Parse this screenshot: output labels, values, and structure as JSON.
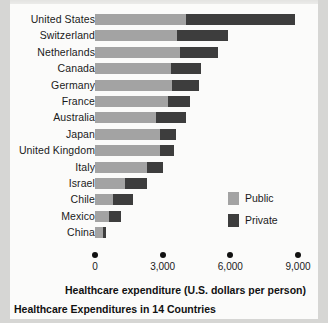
{
  "chart_data": {
    "type": "bar",
    "orientation": "horizontal",
    "stacked": true,
    "title": "",
    "caption": "Healthcare Expenditures in 14 Countries",
    "xlabel": "Healthcare expenditure (U.S. dollars per person)",
    "ylabel": "",
    "xlim": [
      0,
      9000
    ],
    "xticks": [
      0,
      3000,
      6000,
      9000
    ],
    "xtick_labels": [
      "0",
      "3,000",
      "6,000",
      "9,000"
    ],
    "grid": false,
    "legend_position": "inside-right",
    "categories": [
      "United States",
      "Switzerland",
      "Netherlands",
      "Canada",
      "Germany",
      "France",
      "Australia",
      "Japan",
      "United Kingdom",
      "Italy",
      "Israel",
      "Chile",
      "Mexico",
      "China"
    ],
    "series": [
      {
        "name": "Public",
        "color": "#a3a3a3",
        "values": [
          4050,
          3650,
          3750,
          3350,
          3400,
          3250,
          2700,
          2900,
          2900,
          2300,
          1350,
          800,
          600,
          350
        ]
      },
      {
        "name": "Private",
        "color": "#3d3d3d",
        "values": [
          4800,
          2250,
          1700,
          1350,
          1200,
          950,
          1350,
          700,
          600,
          700,
          950,
          900,
          550,
          150
        ]
      }
    ],
    "totals": [
      8850,
      5900,
      5450,
      4700,
      4600,
      4200,
      4050,
      3600,
      3500,
      3000,
      2300,
      1700,
      1150,
      500
    ]
  },
  "legend": {
    "items": [
      {
        "label": "Public",
        "color": "#a3a3a3"
      },
      {
        "label": "Private",
        "color": "#3d3d3d"
      }
    ]
  },
  "axis": {
    "title": "Healthcare expenditure (U.S. dollars per person)",
    "ticks": [
      "0",
      "3,000",
      "6,000",
      "9,000"
    ]
  },
  "caption": {
    "text": "Healthcare Expenditures in 14 Countries"
  },
  "colors": {
    "public": "#a3a3a3",
    "private": "#3d3d3d",
    "page": "#fbfbfa",
    "background": "#d6d6d4",
    "text": "#1a1a1a"
  }
}
